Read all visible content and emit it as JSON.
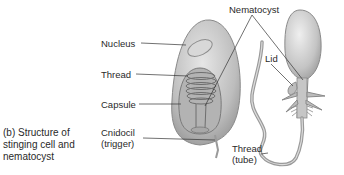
{
  "diagram": {
    "caption_lines": [
      "(b) Structure of",
      "stinging cell and",
      "nematocyst"
    ],
    "labels": {
      "nucleus": "Nucleus",
      "thread": "Thread",
      "capsule": "Capsule",
      "cnidocil_line1": "Cnidocil",
      "cnidocil_line2": "(trigger)",
      "nematocyst": "Nematocyst",
      "lid": "Lid",
      "thread_tube_line1": "Thread",
      "thread_tube_line2": "(tube)"
    },
    "colors": {
      "cell_fill": "#c9c9c9",
      "cell_shade": "#a6a6a6",
      "outline": "#7a7a7a",
      "leader_line": "#333333"
    }
  }
}
